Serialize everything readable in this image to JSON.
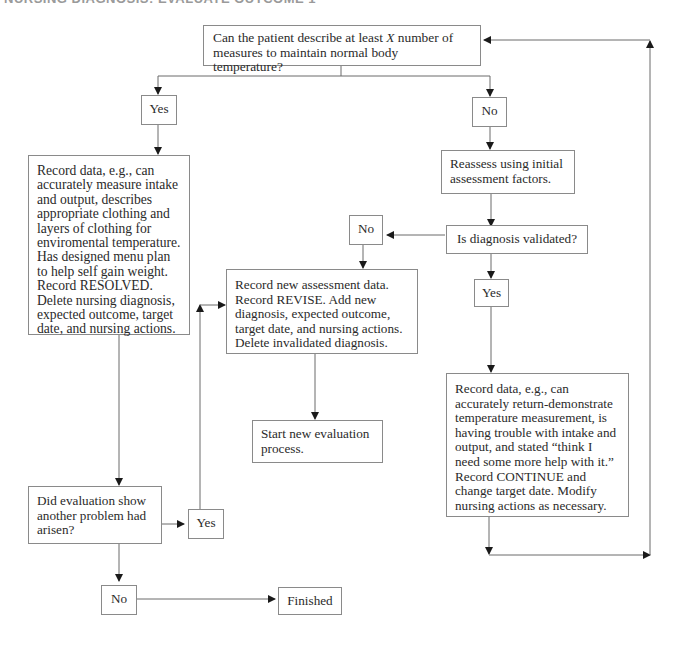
{
  "header": {
    "text": "NURSING DIAGNOSIS: EVALUATE OUTCOME 1"
  },
  "nodes": {
    "question": {
      "pre": "Can the patient describe at least ",
      "var": "X",
      "post": " number of measures to maintain normal body temperature?"
    },
    "yes_top": "Yes",
    "no_top": "No",
    "resolved": "Record data, e.g., can accurately measure intake and output, describes appropriate clothing and layers of clothing for enviromental temperature. Has designed menu plan to help self gain weight. Record RESOLVED. Delete nursing diagnosis, expected outcome, target date, and nursing actions.",
    "reassess": "Reassess using initial assessment factors.",
    "validated_q": "Is diagnosis validated?",
    "no_mid": "No",
    "yes_mid": "Yes",
    "revise": "Record new assessment data. Record REVISE. Add new diagnosis, expected outcome, target date, and nursing actions. Delete invalidated diagnosis.",
    "start_new": "Start new evaluation process.",
    "continue": "Record data, e.g., can accurately return-demonstrate temperature measurement, is having trouble with intake and output, and stated “think I need some more help with it.” Record CONTINUE and change target date. Modify nursing actions as necessary.",
    "another_problem_q": "Did evaluation show another problem had arisen?",
    "yes_bottom": "Yes",
    "no_bottom": "No",
    "finished": "Finished"
  },
  "colors": {
    "line": "#6a6a6a",
    "border": "#8a8a8a",
    "text": "#2a2a2a"
  }
}
